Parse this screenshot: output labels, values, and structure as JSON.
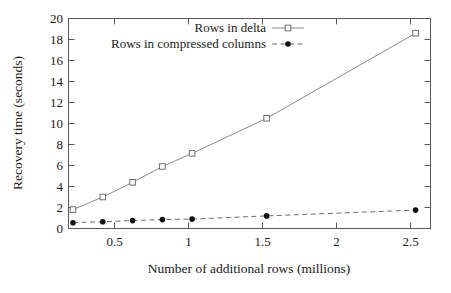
{
  "chart_data": {
    "type": "line",
    "title": "",
    "subtitle": "",
    "xlabel": "Number of additional rows (millions)",
    "ylabel": "Recovery time (seconds)",
    "xlim": [
      0.17,
      2.6
    ],
    "ylim": [
      0,
      20
    ],
    "grid": false,
    "legend_position": "top-center",
    "xticks": [
      0.5,
      1,
      1.5,
      2,
      2.5
    ],
    "xtick_labels": [
      "0.5",
      "1",
      "1.5",
      "2",
      "2.5"
    ],
    "yticks": [
      0,
      2,
      4,
      6,
      8,
      10,
      12,
      14,
      16,
      18,
      20
    ],
    "ytick_labels": [
      "0",
      "2",
      "4",
      "6",
      "8",
      "10",
      "12",
      "14",
      "16",
      "18",
      "20"
    ],
    "series": [
      {
        "name": "Rows in delta",
        "marker": "open-square",
        "linestyle": "solid",
        "color": "#8a8a8a",
        "marker_color": "#6e6e6e",
        "x": [
          0.2,
          0.4,
          0.6,
          0.8,
          1.0,
          1.5,
          2.5
        ],
        "values": [
          1.8,
          3.0,
          4.4,
          5.9,
          7.15,
          10.5,
          18.6
        ]
      },
      {
        "name": "Rows in compressed columns",
        "marker": "filled-circle",
        "linestyle": "dashed",
        "color": "#6e6e6e",
        "marker_color": "#111111",
        "x": [
          0.2,
          0.4,
          0.6,
          0.8,
          1.0,
          1.5,
          2.5
        ],
        "values": [
          0.55,
          0.65,
          0.75,
          0.85,
          0.9,
          1.2,
          1.75
        ]
      }
    ]
  },
  "axes": {
    "x_title": "Number of additional rows (millions)",
    "y_title": "Recovery time (seconds)"
  },
  "legend": {
    "entries": [
      {
        "label": "Rows in delta"
      },
      {
        "label": "Rows in compressed columns"
      }
    ]
  },
  "colors": {
    "frame": "#5a5a5a",
    "delta_line": "#8a8a8a",
    "columns_line": "#6e6e6e",
    "text": "#1a1a1a",
    "background": "#ffffff"
  }
}
